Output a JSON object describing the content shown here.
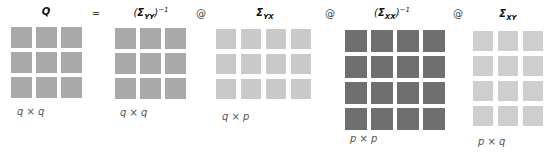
{
  "equation": {
    "operators": [
      "=",
      "@",
      "@",
      "@"
    ],
    "terms": [
      {
        "id": "Q",
        "symbol": "Q",
        "subscript": "",
        "inverse": false,
        "rows": 3,
        "cols": 3,
        "dims": "q × q",
        "color": "#a9a9a9"
      },
      {
        "id": "Sigma_YY_inv",
        "symbol": "Σ",
        "subscript": "YY",
        "inverse": true,
        "superscript": "−1",
        "rows": 3,
        "cols": 3,
        "dims": "q × q",
        "color": "#a9a9a9"
      },
      {
        "id": "Sigma_YX",
        "symbol": "Σ",
        "subscript": "YX",
        "inverse": false,
        "rows": 3,
        "cols": 4,
        "dims": "q × p",
        "color": "#c9c9c9"
      },
      {
        "id": "Sigma_XX_inv",
        "symbol": "Σ",
        "subscript": "XX",
        "inverse": true,
        "superscript": "−1",
        "rows": 4,
        "cols": 4,
        "dims": "p × p",
        "color": "#6f6f6f"
      },
      {
        "id": "Sigma_XY",
        "symbol": "Σ",
        "subscript": "XY",
        "inverse": false,
        "rows": 4,
        "cols": 3,
        "dims": "p × q",
        "color": "#cecece"
      }
    ]
  }
}
